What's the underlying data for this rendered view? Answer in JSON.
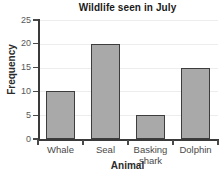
{
  "chart_data": {
    "type": "bar",
    "title": "Wildlife seen in July",
    "xlabel": "Animal",
    "ylabel": "Frequency",
    "categories": [
      "Whale",
      "Seal",
      "Basking shark",
      "Dolphin"
    ],
    "values": [
      10,
      20,
      5,
      15
    ],
    "ylim": [
      0,
      25
    ],
    "yticks": [
      0,
      5,
      10,
      15,
      20,
      25
    ],
    "ytick_labels": [
      "0",
      "5",
      "10",
      "15",
      "20",
      "25"
    ],
    "grid": true,
    "legend": null,
    "bar_color": "#a9a9a9",
    "bar_edge_color": "#3d3d3d",
    "axis_color": "#3a3a3a",
    "gridline_color": "#ededed",
    "background_color": "#ffffff",
    "category_label_lines": [
      [
        "Whale"
      ],
      [
        "Seal"
      ],
      [
        "Basking",
        "shark"
      ],
      [
        "Dolphin"
      ]
    ]
  }
}
